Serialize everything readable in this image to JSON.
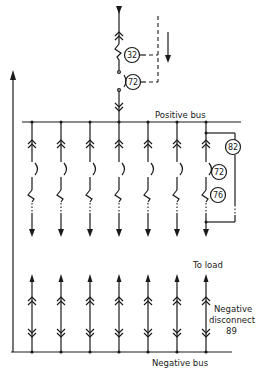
{
  "diagram": {
    "type": "dc switchgear single-line diagram",
    "labels": {
      "positive_bus": "Positive bus",
      "negative_bus": "Negative bus",
      "to_load": "To load",
      "negative_disconnect_line1": "Negative",
      "negative_disconnect_line2": "disconnect",
      "negative_disconnect_number": "89"
    },
    "incoming_feeder_devices": [
      {
        "number": "32",
        "meaning": "reverse-current relay"
      },
      {
        "number": "72",
        "meaning": "dc circuit breaker"
      }
    ],
    "feeder_devices": [
      {
        "number": "82",
        "meaning": "reclosing relay"
      },
      {
        "number": "72",
        "meaning": "dc circuit breaker"
      },
      {
        "number": "76",
        "meaning": "overcurrent relay"
      }
    ],
    "feeder_count": 7,
    "colors": {
      "line": "#1a1a1a",
      "background": "#ffffff"
    }
  }
}
